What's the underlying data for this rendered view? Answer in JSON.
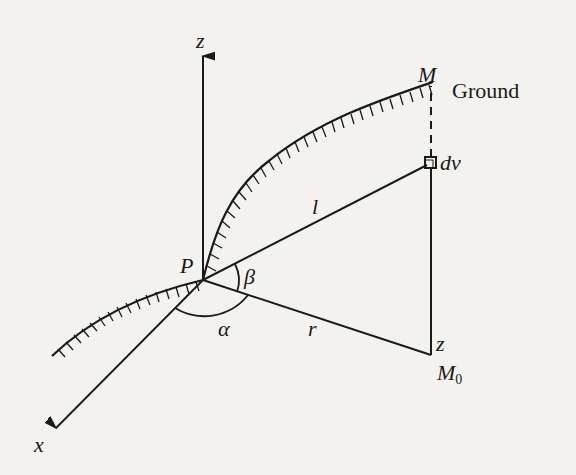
{
  "diagram": {
    "labels": {
      "z_axis": "z",
      "x_axis": "x",
      "point_P": "P",
      "point_M": "M",
      "ground": "Ground",
      "volume_element": "dv",
      "distance_l": "l",
      "distance_r": "r",
      "height_z": "z",
      "point_M0_base": "M",
      "point_M0_sub": "0",
      "angle_alpha": "α",
      "angle_beta": "β"
    },
    "colors": {
      "ink": "#1a1a1a",
      "background": "#f3f2ef"
    },
    "geometry": {
      "P": [
        203,
        280
      ],
      "M": [
        431,
        84
      ],
      "dv": [
        431,
        163
      ],
      "M0": [
        431,
        355
      ],
      "z_tip": [
        203,
        52
      ],
      "x_tip": [
        52,
        432
      ]
    }
  }
}
